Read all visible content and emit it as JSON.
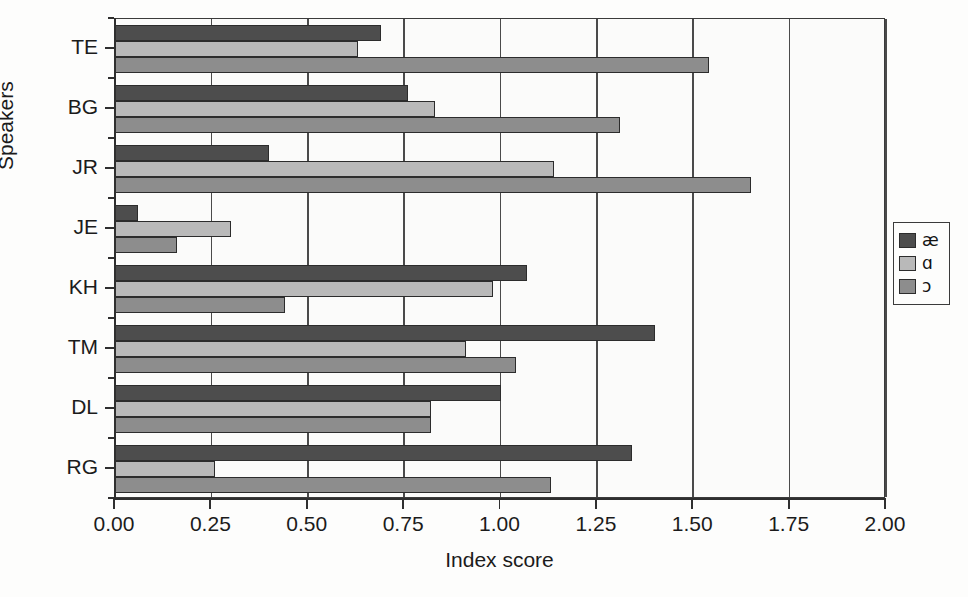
{
  "chart_data": {
    "type": "bar",
    "orientation": "horizontal",
    "title": "",
    "xlabel": "Index score",
    "ylabel": "Speakers",
    "xlim": [
      0.0,
      2.0
    ],
    "xticks": [
      "0.00",
      "0.25",
      "0.50",
      "0.75",
      "1.00",
      "1.25",
      "1.50",
      "1.75",
      "2.00"
    ],
    "xtick_values": [
      0.0,
      0.25,
      0.5,
      0.75,
      1.0,
      1.25,
      1.5,
      1.75,
      2.0
    ],
    "grid": "vertical",
    "legend_position": "right",
    "categories": [
      "TE",
      "BG",
      "JR",
      "JE",
      "KH",
      "TM",
      "DL",
      "RG"
    ],
    "series": [
      {
        "name": "æ",
        "color": "#4d4d4d",
        "values": [
          0.69,
          0.76,
          0.4,
          0.06,
          1.07,
          1.4,
          1.0,
          1.34
        ]
      },
      {
        "name": "ɑ",
        "color": "#b9b9b9",
        "values": [
          0.63,
          0.83,
          1.14,
          0.3,
          0.98,
          0.91,
          0.82,
          0.26
        ]
      },
      {
        "name": "ɔ",
        "color": "#8d8d8d",
        "values": [
          1.54,
          1.31,
          1.65,
          0.16,
          0.44,
          1.04,
          0.82,
          1.13
        ]
      }
    ]
  },
  "legend": {
    "items": [
      {
        "label": "æ",
        "color": "#4d4d4d"
      },
      {
        "label": "ɑ",
        "color": "#b9b9b9"
      },
      {
        "label": "ɔ",
        "color": "#8d8d8d"
      }
    ]
  },
  "ghost_text": [
    "a  the  common  matter",
    "to  nearly  the  assimilate",
    "A  suggest  that  response  value  for  in  A",
    "Al  a  a  ii  fo  the  wider  for  i  don  transfer"
  ]
}
